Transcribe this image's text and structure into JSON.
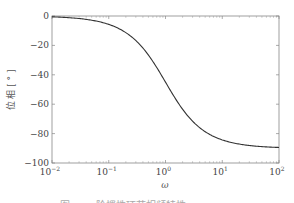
{
  "chart_data": {
    "type": "line",
    "title": "",
    "xlabel": "ω",
    "ylabel": "位 相 [ ° ]",
    "xscale": "log",
    "xlim": [
      0.01,
      100
    ],
    "ylim": [
      -100,
      0
    ],
    "x_ticks": [
      {
        "base": "10",
        "exp": "−2",
        "value": 0.01
      },
      {
        "base": "10",
        "exp": "−1",
        "value": 0.1
      },
      {
        "base": "10",
        "exp": "0",
        "value": 1
      },
      {
        "base": "10",
        "exp": "1",
        "value": 10
      },
      {
        "base": "10",
        "exp": "2",
        "value": 100
      }
    ],
    "y_ticks": [
      "0",
      "−20",
      "−40",
      "−60",
      "−80",
      "−100"
    ],
    "y_tick_values": [
      0,
      -20,
      -40,
      -60,
      -80,
      -100
    ],
    "grid": false,
    "legend": null,
    "series": [
      {
        "name": "phase",
        "formula": "-arctan(ω) in degrees",
        "x": [
          0.01,
          0.02,
          0.05,
          0.1,
          0.2,
          0.3,
          0.5,
          0.7,
          1,
          1.5,
          2,
          3,
          5,
          7,
          10,
          20,
          50,
          100
        ],
        "values": [
          -0.57,
          -1.15,
          -2.86,
          -5.71,
          -11.31,
          -16.7,
          -26.57,
          -34.99,
          -45.0,
          -56.31,
          -63.43,
          -71.57,
          -78.69,
          -81.87,
          -84.29,
          -87.14,
          -88.85,
          -89.43
        ]
      }
    ],
    "line_color": "#333333"
  },
  "caption": "图 — 一阶惯性环节相频特性"
}
